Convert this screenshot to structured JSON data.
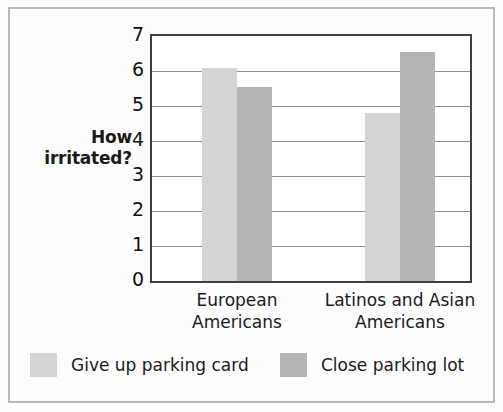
{
  "chart_data": {
    "type": "bar",
    "title": "",
    "xlabel": "",
    "ylabel": "How\nirritated?",
    "ylabel_line1": "How",
    "ylabel_line2": "irritated?",
    "categories": [
      "European Americans",
      "Latinos and Asian Americans"
    ],
    "category_lines": [
      [
        "European",
        "Americans"
      ],
      [
        "Latinos and Asian",
        "Americans"
      ]
    ],
    "series": [
      {
        "name": "Give up parking card",
        "values": [
          6.1,
          4.8
        ],
        "color": "#d4d4d4"
      },
      {
        "name": "Close parking lot",
        "values": [
          5.55,
          6.55
        ],
        "color": "#b5b5b5"
      }
    ],
    "ylim": [
      0,
      7
    ],
    "yticks": [
      7,
      6,
      5,
      4,
      3,
      2,
      1,
      0
    ],
    "ytick_labels": [
      "7",
      "6",
      "5",
      "4",
      "3",
      "2",
      "1",
      "0"
    ],
    "grid": true,
    "grid_axis": "y",
    "legend_position": "bottom"
  },
  "legend": {
    "items": [
      {
        "label": "Give up parking card",
        "color": "#d4d4d4"
      },
      {
        "label": "Close parking lot",
        "color": "#b5b5b5"
      }
    ]
  },
  "colors": {
    "series_light": "#d4d4d4",
    "series_dark": "#b5b5b5",
    "axis": "#3f3f3f",
    "grid": "#8f8f8f",
    "text": "#1a1a1a",
    "frame": "#b9b9b9"
  }
}
